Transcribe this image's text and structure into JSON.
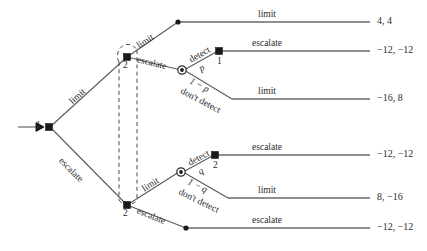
{
  "diagram": {
    "type": "extensive-form-game-tree",
    "root": {
      "player": "1",
      "entry_arrow": true
    }
  },
  "players": {
    "p1": "1",
    "p2": "2"
  },
  "actions": {
    "limit": "limit",
    "escalate": "escalate",
    "detect": "detect",
    "dont_detect": "don't detect"
  },
  "probabilities": {
    "p": "p",
    "one_minus_p": "1 − p",
    "q": "q",
    "one_minus_q": "1 − q"
  },
  "node_labels": {
    "root": "1",
    "upper_p2": "2",
    "upper_p1": "1",
    "lower_p2_left": "2",
    "lower_p2_right": "2"
  },
  "payoffs": {
    "limit_limit": "4, 4",
    "detect_escalate_upper": "−12, −12",
    "dont_detect_limit_upper": "−16, 8",
    "detect_escalate_lower": "−12, −12",
    "dont_detect_limit_lower": "8, −16",
    "escalate_escalate": "−12, −12"
  },
  "edge_labels": {
    "e1_root_limit": "limit",
    "e2_root_escalate": "escalate",
    "e3_upper2_limit": "limit",
    "e4_upper2_escalate": "escalate",
    "e5_top_terminal_limit": "limit",
    "e6_chance_detect": "detect",
    "e7_chance_dont_detect": "don't detect",
    "e8_p1_escalate": "escalate",
    "e9_dontdetect_limit": "limit",
    "e10_lower2_limit": "limit",
    "e11_lower2_escalate": "escalate",
    "e12_chance2_detect": "detect",
    "e13_chance2_dont_detect": "don't detect",
    "e14_p2_escalate": "escalate",
    "e15_dontdetect2_limit": "limit",
    "e16_bottom_escalate": "escalate"
  },
  "colors": {
    "line": "#5a5a5a",
    "node": "#1a1a1a",
    "text": "#2b2b2b",
    "background": "#ffffff"
  }
}
